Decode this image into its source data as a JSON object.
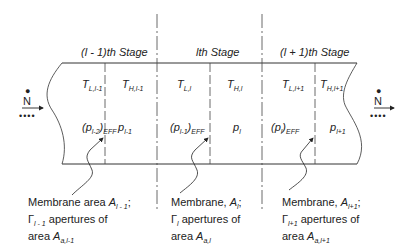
{
  "diagram": {
    "stages": [
      {
        "label_pre": "(",
        "label_var": "l",
        "label_post": " - 1)th Stage"
      },
      {
        "label_pre": "",
        "label_var": "l",
        "label_post": "th Stage"
      },
      {
        "label_pre": "(",
        "label_var": "l",
        "label_post": " + 1)th Stage"
      }
    ],
    "temperatures": [
      {
        "sym": "T",
        "sub": "L,l-1"
      },
      {
        "sym": "T",
        "sub": "H,l-1"
      },
      {
        "sym": "T",
        "sub": "L,l"
      },
      {
        "sym": "T",
        "sub": "H,l"
      },
      {
        "sym": "T",
        "sub": "L,l+1"
      },
      {
        "sym": "T",
        "sub": "H,l+1"
      }
    ],
    "pressures": [
      {
        "text": "(p",
        "sub": "l-2",
        "close": ")",
        "sub2": "EFF"
      },
      {
        "text": "p",
        "sub": "l-1"
      },
      {
        "text": "(p",
        "sub": "l-1",
        "close": ")",
        "sub2": "EFF"
      },
      {
        "text": "p",
        "sub": "l"
      },
      {
        "text": "(p",
        "sub": "l",
        "close": ")",
        "sub2": "EFF"
      },
      {
        "text": "p",
        "sub": "l+1"
      }
    ],
    "flow_left": {
      "sym": "N",
      "dots": "••••"
    },
    "flow_right": {
      "sym": "N",
      "dots": "••••"
    },
    "captions": [
      {
        "line1": "Membrane area ",
        "a": "A",
        "a_sub": "l - 1",
        "line1_end": ";",
        "gamma": "Γ",
        "gamma_sub": "l - 1",
        "line2": " apertures of",
        "line3": "area ",
        "aa": "A",
        "aa_sub": "a,l-1"
      },
      {
        "line1": "Membrane, ",
        "a": "A",
        "a_sub": "l",
        "line1_end": ";",
        "gamma": "Γ",
        "gamma_sub": "l",
        "line2": " apertures of",
        "line3": "area ",
        "aa": "A",
        "aa_sub": "a,l"
      },
      {
        "line1": "Membrane, ",
        "a": "A",
        "a_sub": "l+1",
        "line1_end": ";",
        "gamma": "Γ",
        "gamma_sub": "l+1",
        "line2": " apertures of",
        "line3": "area ",
        "aa": "A",
        "aa_sub": "a,l+1"
      }
    ]
  }
}
